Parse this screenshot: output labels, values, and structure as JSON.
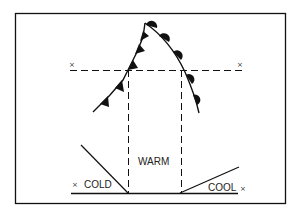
{
  "diagram": {
    "type": "weather-front-cross-section",
    "labels": {
      "warm": "WARM",
      "cold": "COLD",
      "cool": "COOL"
    },
    "markers": {
      "x_symbol": "×"
    },
    "elements": {
      "cold_front": "cold-front-with-triangles",
      "warm_front": "warm-front-with-semicircles",
      "section_line": "dashed-cross-section-line",
      "ground_line": "surface-baseline"
    },
    "colors": {
      "ink": "#111111",
      "background": "#ffffff"
    }
  }
}
